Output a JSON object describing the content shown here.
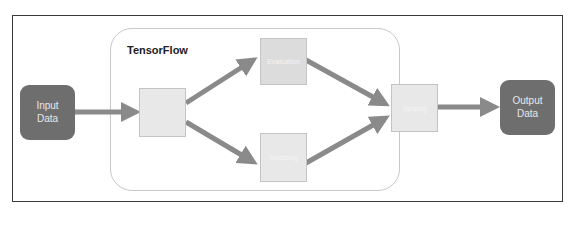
{
  "diagram": {
    "container": {
      "title": "TensorFlow"
    },
    "endpoints": {
      "input": {
        "label": "Input\nData",
        "color": "#6e6e6e"
      },
      "output": {
        "label": "Output\nData",
        "color": "#6e6e6e"
      }
    },
    "stages": {
      "entry": {
        "label": "",
        "legible": false
      },
      "top": {
        "label": "Evaluation",
        "legible": "low"
      },
      "bottom": {
        "label": "Modeling",
        "legible": "low"
      },
      "exit": {
        "label": "Serving",
        "legible": "low"
      }
    },
    "arrows": [
      {
        "from": "input",
        "to": "entry"
      },
      {
        "from": "entry",
        "to": "top"
      },
      {
        "from": "entry",
        "to": "bottom"
      },
      {
        "from": "top",
        "to": "exit"
      },
      {
        "from": "bottom",
        "to": "exit"
      },
      {
        "from": "exit",
        "to": "output"
      }
    ],
    "colors": {
      "arrow": "#8a8a8a",
      "stage_fill": "#e8e8e8",
      "frame": "#3a3a3a",
      "container_border": "#c8c8c8"
    }
  }
}
